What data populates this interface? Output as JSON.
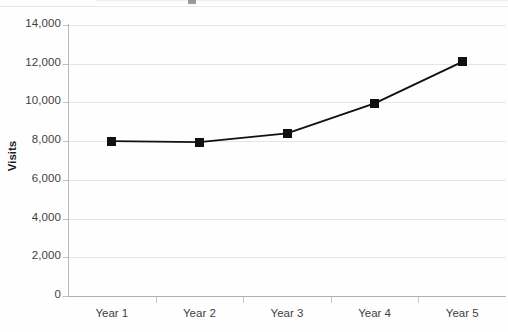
{
  "chart_data": {
    "type": "line",
    "title": "",
    "xlabel": "",
    "ylabel": "Visits",
    "categories": [
      "Year 1",
      "Year 2",
      "Year 3",
      "Year 4",
      "Year 5"
    ],
    "values": [
      8000,
      7950,
      8400,
      9950,
      12100
    ],
    "series": [
      {
        "name": "Visits",
        "values": [
          8000,
          7950,
          8400,
          9950,
          12100
        ]
      }
    ],
    "ylim": [
      0,
      14000
    ],
    "ytick_labels": [
      "14,000",
      "12,000",
      "10,000",
      "8,000",
      "6,000",
      "4,000",
      "2,000",
      "0"
    ],
    "ytick_values": [
      14000,
      12000,
      10000,
      8000,
      6000,
      4000,
      2000,
      0
    ],
    "grid": true,
    "legend": "none",
    "marker": "square",
    "line_color": "#111111",
    "marker_color": "#111111",
    "grid_color": "#e6e6e6",
    "axis_color": "#b9b9b9",
    "background_color": "#fefefe"
  },
  "axes": {
    "y_label": "Visits"
  }
}
